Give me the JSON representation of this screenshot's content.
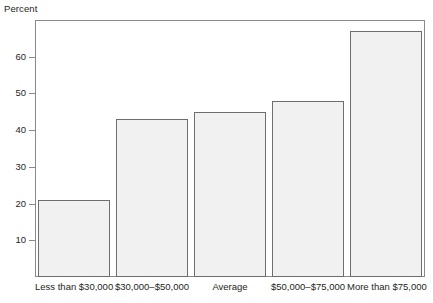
{
  "chart_data": {
    "type": "bar",
    "title": "",
    "subtitle": "",
    "xlabel": "",
    "ylabel": "Percent",
    "categories": [
      "Less than $30,000",
      "$30,000–$50,000",
      "Average",
      "$50,000–$75,000",
      "More than $75,000"
    ],
    "values": [
      21,
      43,
      45,
      48,
      67
    ],
    "ylim": [
      0,
      70
    ],
    "yticks": [
      10,
      20,
      30,
      40,
      50,
      60
    ],
    "ytick_labels": [
      "10",
      "20",
      "30",
      "40",
      "50",
      "60"
    ],
    "grid": false,
    "legend": false,
    "legend_position": "none",
    "bar_fill_color": "#f1f1f1",
    "bar_border_color": "#6e6e6e",
    "axis_color": "#8a8a8a",
    "text_color": "#231f20",
    "background_color": "#ffffff"
  }
}
